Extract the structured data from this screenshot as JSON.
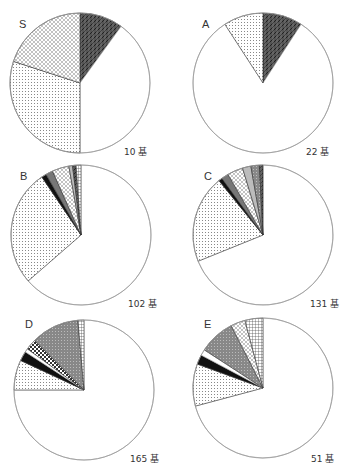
{
  "chart_data": [
    {
      "type": "pie",
      "title": "S",
      "total_label": "10 基",
      "total": 10,
      "center": [
        80,
        83
      ],
      "radius": 70,
      "slices": [
        {
          "pattern": "dark-hatch",
          "value": 1,
          "start": 0,
          "end": 36
        },
        {
          "pattern": "white",
          "value": 4,
          "start": 36,
          "end": 180
        },
        {
          "pattern": "dots",
          "value": 3,
          "start": 180,
          "end": 288
        },
        {
          "pattern": "crosshatch",
          "value": 2,
          "start": 288,
          "end": 360
        }
      ]
    },
    {
      "type": "pie",
      "title": "A",
      "total_label": "22 基",
      "total": 22,
      "center": [
        263,
        83
      ],
      "radius": 70,
      "slices": [
        {
          "pattern": "dark-hatch",
          "value": 2,
          "start": 0,
          "end": 33
        },
        {
          "pattern": "white",
          "value": 18,
          "start": 33,
          "end": 327
        },
        {
          "pattern": "dots",
          "value": 2,
          "start": 327,
          "end": 360
        }
      ]
    },
    {
      "type": "pie",
      "title": "B",
      "total_label": "102 基",
      "total": 102,
      "center": [
        81,
        235
      ],
      "radius": 70,
      "slices": [
        {
          "pattern": "white",
          "value": 65,
          "start": 0,
          "end": 229
        },
        {
          "pattern": "dots",
          "value": 27,
          "start": 229,
          "end": 326
        },
        {
          "pattern": "black",
          "value": 1,
          "start": 326,
          "end": 330
        },
        {
          "pattern": "gray",
          "value": 2,
          "start": 330,
          "end": 336
        },
        {
          "pattern": "crosshatch",
          "value": 4,
          "start": 336,
          "end": 350
        },
        {
          "pattern": "vlines",
          "value": 1,
          "start": 350,
          "end": 353
        },
        {
          "pattern": "dark-hatch",
          "value": 1,
          "start": 353,
          "end": 356
        },
        {
          "pattern": "grid",
          "value": 1,
          "start": 356,
          "end": 360
        }
      ]
    },
    {
      "type": "pie",
      "title": "C",
      "total_label": "131 基",
      "total": 131,
      "center": [
        263,
        235
      ],
      "radius": 70,
      "slices": [
        {
          "pattern": "white",
          "value": 90,
          "start": 0,
          "end": 248
        },
        {
          "pattern": "dots",
          "value": 27,
          "start": 248,
          "end": 321
        },
        {
          "pattern": "black",
          "value": 1,
          "start": 321,
          "end": 324
        },
        {
          "pattern": "gray",
          "value": 2,
          "start": 324,
          "end": 330
        },
        {
          "pattern": "crosshatch",
          "value": 5,
          "start": 330,
          "end": 343
        },
        {
          "pattern": "vlines",
          "value": 2,
          "start": 343,
          "end": 350
        },
        {
          "pattern": "gray-dots",
          "value": 3,
          "start": 350,
          "end": 357
        },
        {
          "pattern": "dark-hatch",
          "value": 1,
          "start": 357,
          "end": 360
        }
      ]
    },
    {
      "type": "pie",
      "title": "D",
      "total_label": "165 基",
      "total": 165,
      "center": [
        84,
        390
      ],
      "radius": 70,
      "slices": [
        {
          "pattern": "white",
          "value": 124,
          "start": 0,
          "end": 270
        },
        {
          "pattern": "dots",
          "value": 11,
          "start": 270,
          "end": 295
        },
        {
          "pattern": "black",
          "value": 4,
          "start": 295,
          "end": 303
        },
        {
          "pattern": "white",
          "value": 1,
          "start": 303,
          "end": 306
        },
        {
          "pattern": "checker",
          "value": 4,
          "start": 306,
          "end": 315
        },
        {
          "pattern": "gray-dots",
          "value": 18,
          "start": 315,
          "end": 355
        },
        {
          "pattern": "grid",
          "value": 2,
          "start": 355,
          "end": 360
        }
      ]
    },
    {
      "type": "pie",
      "title": "E",
      "total_label": "51 基",
      "total": 51,
      "center": [
        263,
        388
      ],
      "radius": 70,
      "slices": [
        {
          "pattern": "white",
          "value": 36,
          "start": 0,
          "end": 255
        },
        {
          "pattern": "dots",
          "value": 5,
          "start": 255,
          "end": 290
        },
        {
          "pattern": "black",
          "value": 1,
          "start": 290,
          "end": 298
        },
        {
          "pattern": "white",
          "value": 1,
          "start": 298,
          "end": 303
        },
        {
          "pattern": "gray-dots",
          "value": 4,
          "start": 303,
          "end": 333
        },
        {
          "pattern": "crosshatch",
          "value": 2,
          "start": 333,
          "end": 345
        },
        {
          "pattern": "grid",
          "value": 2,
          "start": 345,
          "end": 360
        }
      ]
    }
  ],
  "labels": {
    "S": {
      "title": "S",
      "count": "10 基"
    },
    "A": {
      "title": "A",
      "count": "22 基"
    },
    "B": {
      "title": "B",
      "count": "102 基"
    },
    "C": {
      "title": "C",
      "count": "131 基"
    },
    "D": {
      "title": "D",
      "count": "165 基"
    },
    "E": {
      "title": "E",
      "count": "51 基"
    }
  }
}
